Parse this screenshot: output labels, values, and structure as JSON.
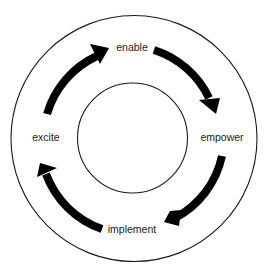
{
  "diagram": {
    "type": "cycle",
    "direction": "clockwise",
    "stages": [
      {
        "label": "enable"
      },
      {
        "label": "empower"
      },
      {
        "label": "implement"
      },
      {
        "label": "excite"
      }
    ],
    "connections": [
      {
        "from": "excite",
        "to": "enable"
      },
      {
        "from": "enable",
        "to": "empower"
      },
      {
        "from": "empower",
        "to": "implement"
      },
      {
        "from": "implement",
        "to": "excite"
      }
    ],
    "colors": {
      "background": "#ffffff",
      "stroke": "#1a1a1a",
      "arrow": "#000000",
      "text": "#1a1a1a"
    }
  }
}
